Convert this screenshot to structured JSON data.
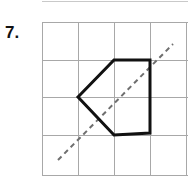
{
  "page": {
    "background": "#ffffff",
    "width": 188,
    "height": 186
  },
  "top_rule": {
    "name": "top-rule",
    "color": "#c9c9c9",
    "x1": 42,
    "y1": 1,
    "x2": 188,
    "y2": 1
  },
  "problem": {
    "number_label": "7.",
    "label_color": "#111111"
  },
  "figure": {
    "caption": "Pentagon on a square grid with a dashed diagonal line of reflection",
    "grid": {
      "color": "#a8a8a8",
      "stroke_width": 1,
      "x_lines": [
        42,
        78,
        114,
        150,
        186
      ],
      "y_lines": [
        22,
        60,
        97,
        135,
        175
      ],
      "columns": 4,
      "rows": 4,
      "cell_width": 36,
      "cell_height": 38,
      "clipped_right": true
    },
    "polygon": {
      "name": "pentagon",
      "color": "#111111",
      "stroke_width": 3,
      "fill": "none",
      "closed": true,
      "vertices": [
        [
          78,
          97
        ],
        [
          114,
          60
        ],
        [
          150,
          60
        ],
        [
          150,
          133
        ],
        [
          114,
          135
        ]
      ],
      "vertex_labels": [
        "left",
        "top-left",
        "top-right",
        "right",
        "bottom"
      ]
    },
    "mirror_line": {
      "name": "line-of-reflection",
      "color": "#6f6f6f",
      "stroke_width": 2,
      "dash_pattern": "5 4",
      "x1": 58,
      "y1": 160,
      "x2": 173,
      "y2": 44,
      "style": "dashed",
      "slope_description": "diagonal, bottom-left to top-right"
    }
  },
  "chart_data": {
    "type": "scatter",
    "xlabel": "",
    "ylabel": "",
    "xlim": [
      0,
      4
    ],
    "ylim": [
      0,
      4
    ],
    "grid": true,
    "legend_position": "none",
    "series": [
      {
        "name": "pentagon",
        "kind": "closed-polyline",
        "grid_units": [
          [
            1,
            2
          ],
          [
            2,
            3
          ],
          [
            3,
            3
          ],
          [
            3,
            1
          ],
          [
            2,
            1
          ]
        ]
      },
      {
        "name": "line-of-reflection",
        "kind": "dashed-line",
        "grid_units": [
          [
            0.45,
            0.4
          ],
          [
            3.65,
            3.45
          ]
        ]
      }
    ]
  }
}
